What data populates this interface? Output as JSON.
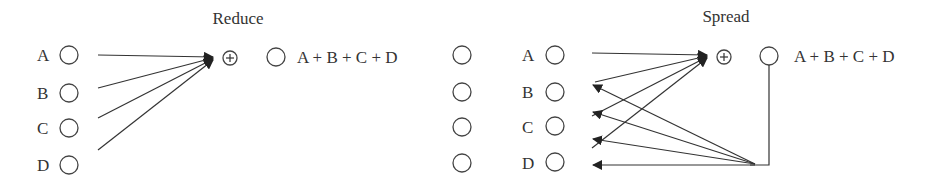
{
  "diagram": {
    "reduce": {
      "title": "Reduce",
      "inputs": [
        "A",
        "B",
        "C",
        "D"
      ],
      "operator": "⊕",
      "result": "A + B + C + D",
      "spare_nodes": 4
    },
    "spread": {
      "title": "Spread",
      "inputs": [
        "A",
        "B",
        "C",
        "D"
      ],
      "operator": "⊕",
      "result": "A + B + C + D"
    },
    "colors": {
      "stroke": "#333333",
      "background": "#ffffff"
    }
  }
}
